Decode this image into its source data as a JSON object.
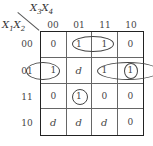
{
  "kmap": {
    "col_var_label": "X3X4",
    "row_var_label": "X1X2",
    "col_headers": [
      "00",
      "01",
      "11",
      "10"
    ],
    "row_headers": [
      "00",
      "01",
      "11",
      "10"
    ],
    "cells": [
      [
        "0",
        "1",
        "1",
        "0"
      ],
      [
        "1",
        "d",
        "1",
        "1"
      ],
      [
        "0",
        "1",
        "0",
        "0"
      ],
      [
        "d",
        "d",
        "d",
        "0"
      ]
    ],
    "groupings": [
      {
        "description": "row 00, columns 01-11 pair"
      },
      {
        "description": "row 01, columns 10-00 wrap-around pair"
      },
      {
        "description": "row 01, columns 11-10 pair"
      },
      {
        "description": "row 01, column 10 single circle"
      },
      {
        "description": "row 11, column 01 single circle"
      }
    ]
  }
}
